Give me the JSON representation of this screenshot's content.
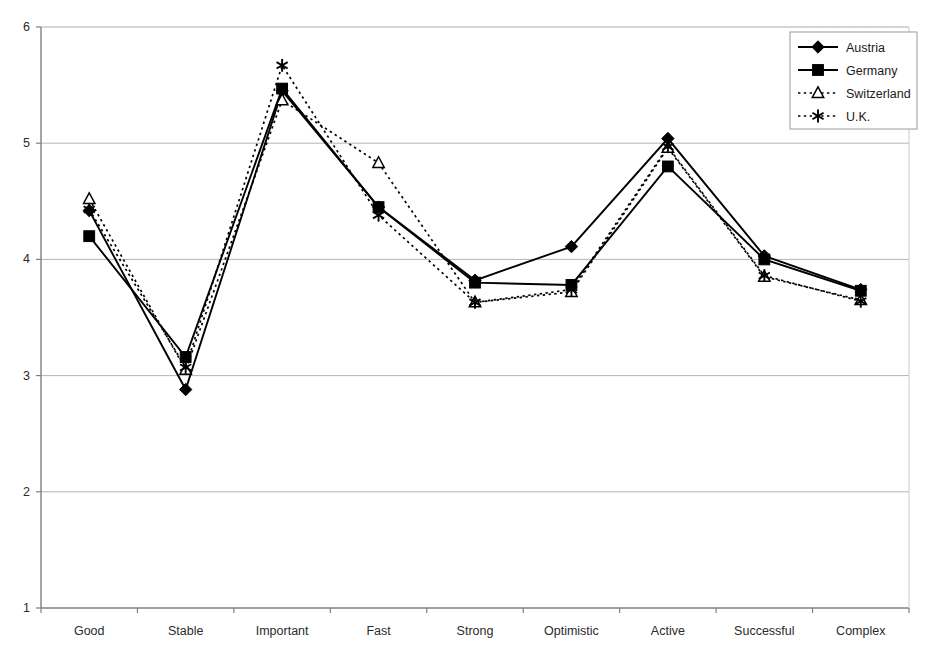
{
  "chart_data": {
    "type": "line",
    "title": "",
    "xlabel": "",
    "ylabel": "",
    "categories": [
      "Good",
      "Stable",
      "Important",
      "Fast",
      "Strong",
      "Optimistic",
      "Active",
      "Successful",
      "Complex"
    ],
    "ylim": [
      1,
      6
    ],
    "ytick_labels": [
      "1",
      "2",
      "3",
      "4",
      "5",
      "6"
    ],
    "yticks": [
      1,
      2,
      3,
      4,
      5,
      6
    ],
    "grid": true,
    "grid_axis": "y",
    "legend_position": "top-right",
    "series": [
      {
        "name": "Austria",
        "marker": "filled-diamond",
        "line_style": "solid",
        "color": "#000000",
        "values": [
          4.42,
          2.88,
          5.45,
          4.45,
          3.82,
          4.11,
          5.04,
          4.03,
          3.74
        ]
      },
      {
        "name": "Germany",
        "marker": "filled-square",
        "line_style": "solid",
        "color": "#000000",
        "values": [
          4.2,
          3.16,
          5.47,
          4.45,
          3.8,
          3.78,
          4.8,
          4.0,
          3.73
        ]
      },
      {
        "name": "Switzerland",
        "marker": "open-triangle",
        "line_style": "dotted",
        "color": "#000000",
        "values": [
          4.52,
          3.05,
          5.37,
          4.83,
          3.63,
          3.72,
          4.96,
          3.85,
          3.65
        ]
      },
      {
        "name": "U.K.",
        "marker": "asterisk",
        "line_style": "dotted",
        "color": "#000000",
        "values": [
          4.43,
          3.07,
          5.67,
          4.38,
          3.63,
          3.74,
          4.97,
          3.86,
          3.64
        ]
      }
    ]
  },
  "axes": {
    "y_ticks": [
      "6",
      "5",
      "4",
      "3",
      "2",
      "1"
    ],
    "x_labels": [
      "Good",
      "Stable",
      "Important",
      "Fast",
      "Strong",
      "Optimistic",
      "Active",
      "Successful",
      "Complex"
    ]
  },
  "legend": {
    "entries": [
      {
        "label": "Austria",
        "marker": "filled-diamond",
        "line_style": "solid"
      },
      {
        "label": "Germany",
        "marker": "filled-square",
        "line_style": "solid"
      },
      {
        "label": "Switzerland",
        "marker": "open-triangle",
        "line_style": "dotted"
      },
      {
        "label": "U.K.",
        "marker": "asterisk",
        "line_style": "dotted"
      }
    ]
  },
  "style": {
    "axis_color": "#808080",
    "grid_color": "#b5b5b5",
    "series_color": "#000000",
    "text_color": "#2b2b2b",
    "background": "#ffffff"
  }
}
